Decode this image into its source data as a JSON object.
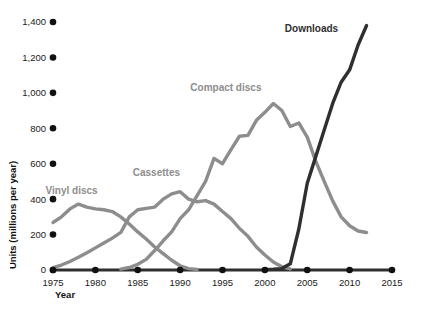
{
  "chart_data": {
    "type": "line",
    "title": "",
    "xlabel": "Year",
    "ylabel": "Units (millions per year)",
    "xlim": [
      1975,
      2015
    ],
    "ylim": [
      0,
      1400
    ],
    "grid": false,
    "legend_position": "inline-series-labels",
    "x_ticks": [
      "1975",
      "1980",
      "1985",
      "1990",
      "1995",
      "2000",
      "2005",
      "2010",
      "2015"
    ],
    "y_ticks": [
      "0",
      "200",
      "400",
      "600",
      "800",
      "1,000",
      "1,200",
      "1,400"
    ],
    "series": [
      {
        "name": "Vinyl discs",
        "color": "#8d8d8d",
        "label_x": 1977.2,
        "label_y": 430,
        "x": [
          1975,
          1976,
          1977,
          1978,
          1979,
          1980,
          1981,
          1982,
          1983,
          1984,
          1985,
          1986,
          1987,
          1988,
          1989,
          1990,
          1991,
          1992
        ],
        "values": [
          268,
          300,
          345,
          372,
          355,
          345,
          340,
          330,
          300,
          260,
          215,
          175,
          130,
          92,
          55,
          24,
          8,
          3
        ]
      },
      {
        "name": "Cassettes",
        "color": "#8d8d8d",
        "label_x": 1987.2,
        "label_y": 530,
        "x": [
          1975,
          1976,
          1977,
          1978,
          1979,
          1980,
          1981,
          1982,
          1983,
          1984,
          1985,
          1986,
          1987,
          1988,
          1989,
          1990,
          1991,
          1992,
          1993,
          1994,
          1995,
          1996,
          1997,
          1998,
          1999,
          2000,
          2001,
          2002,
          2003
        ],
        "values": [
          14,
          28,
          48,
          72,
          98,
          125,
          152,
          180,
          212,
          300,
          340,
          348,
          355,
          400,
          430,
          442,
          400,
          385,
          392,
          372,
          330,
          290,
          235,
          190,
          130,
          85,
          45,
          18,
          6
        ]
      },
      {
        "name": "Compact discs",
        "color": "#8d8d8d",
        "label_x": 1995.4,
        "label_y": 1010,
        "x": [
          1983,
          1984,
          1985,
          1986,
          1987,
          1988,
          1989,
          1990,
          1991,
          1992,
          1993,
          1994,
          1995,
          1996,
          1997,
          1998,
          1999,
          2000,
          2001,
          2002,
          2003,
          2004,
          2005,
          2006,
          2007,
          2008,
          2009,
          2010,
          2011,
          2012
        ],
        "values": [
          5,
          14,
          32,
          60,
          110,
          165,
          215,
          290,
          340,
          420,
          500,
          630,
          600,
          680,
          755,
          760,
          845,
          890,
          940,
          900,
          810,
          830,
          750,
          615,
          500,
          390,
          300,
          250,
          220,
          212
        ]
      },
      {
        "name": "Downloads",
        "color": "#2f2f2f",
        "label_x": 2005.5,
        "label_y": 1345,
        "x": [
          2000,
          2001,
          2002,
          2003,
          2004,
          2005,
          2006,
          2007,
          2008,
          2009,
          2010,
          2011,
          2012
        ],
        "values": [
          2,
          4,
          8,
          35,
          230,
          490,
          640,
          790,
          940,
          1060,
          1130,
          1270,
          1380
        ]
      }
    ]
  }
}
